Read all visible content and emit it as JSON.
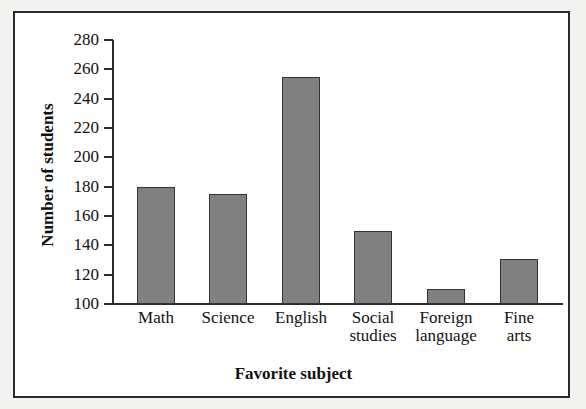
{
  "chart_data": {
    "type": "bar",
    "title": "",
    "xlabel": "Favorite subject",
    "ylabel": "Number of students",
    "categories": [
      "Math",
      "Science",
      "English",
      "Social studies",
      "Foreign language",
      "Fine arts"
    ],
    "category_lines": [
      [
        "Math"
      ],
      [
        "Science"
      ],
      [
        "English"
      ],
      [
        "Social",
        "studies"
      ],
      [
        "Foreign",
        "language"
      ],
      [
        "Fine",
        "arts"
      ]
    ],
    "values": [
      180,
      175,
      255,
      150,
      110,
      131
    ],
    "ylim": [
      100,
      280
    ],
    "ytick_step": 20,
    "yticks": [
      100,
      120,
      140,
      160,
      180,
      200,
      220,
      240,
      260,
      280
    ],
    "ytick_labels": [
      "100",
      "120",
      "140",
      "160",
      "180",
      "200",
      "220",
      "240",
      "260",
      "280"
    ],
    "grid": false,
    "legend": false,
    "bar_color": "#808080",
    "bar_edge_color": "#333333",
    "axis_color": "#2b2b2b",
    "background_color": "#ffffff"
  }
}
